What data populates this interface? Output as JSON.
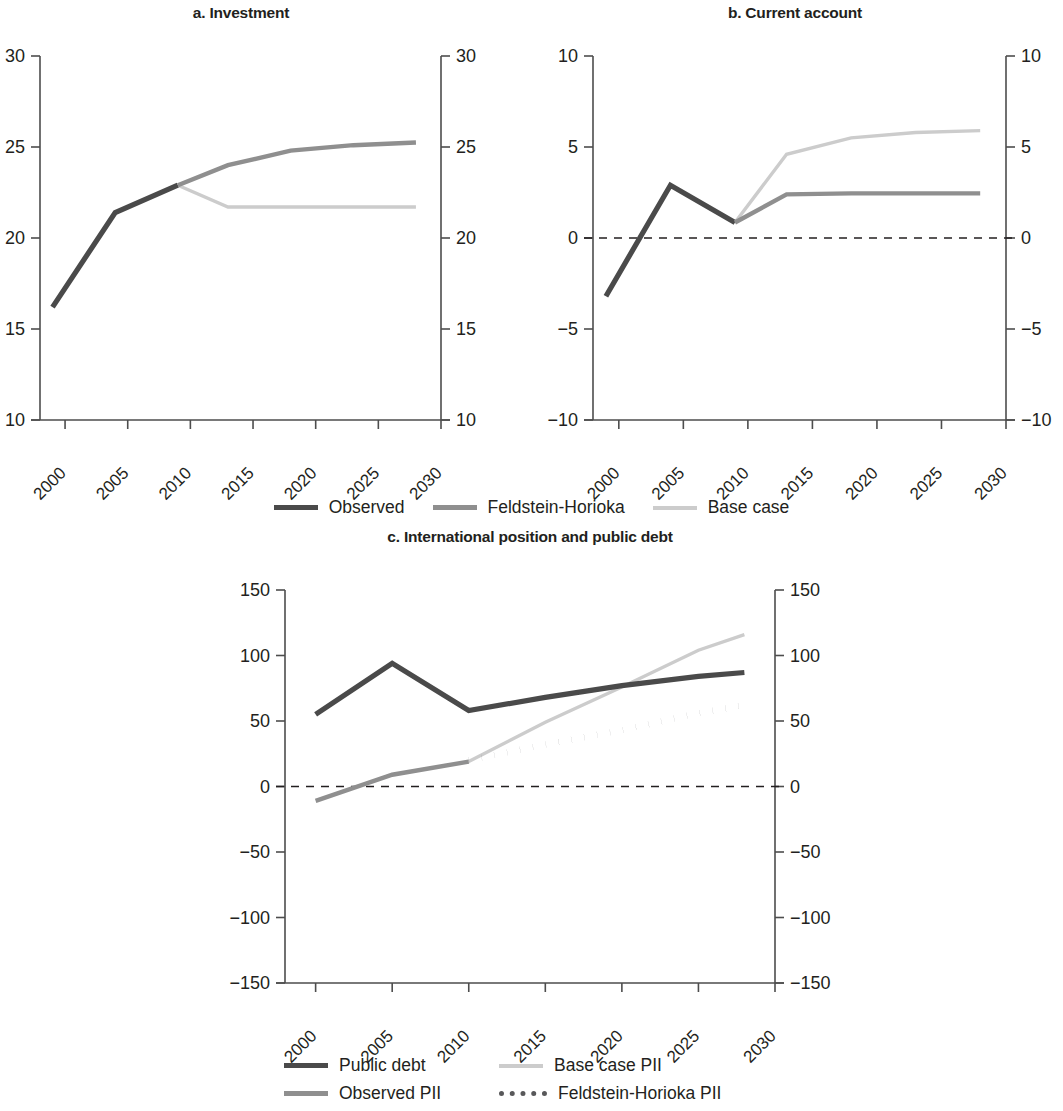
{
  "figure": {
    "panels": [
      {
        "id": "a",
        "title": "a. Investment"
      },
      {
        "id": "b",
        "title": "b. Current account"
      },
      {
        "id": "c",
        "title": "c. International position and public debt"
      }
    ]
  },
  "colors": {
    "observed": "#4a4a4a",
    "feldstein_horioka": "#8f8f8f",
    "base_case": "#cccccc",
    "axis": "#4d4d4d",
    "text": "#231f20"
  },
  "legend_top": {
    "items": [
      {
        "label": "Observed",
        "style": "solid-dark"
      },
      {
        "label": "Feldstein-Horioka",
        "style": "solid-mid"
      },
      {
        "label": "Base case",
        "style": "solid-light"
      }
    ]
  },
  "legend_bottom": {
    "items": [
      {
        "label": "Public debt",
        "style": "solid-dark"
      },
      {
        "label": "Base case PII",
        "style": "solid-light"
      },
      {
        "label": "Observed PII",
        "style": "solid-mid"
      },
      {
        "label": "Feldstein-Horioka PII",
        "style": "dotted-dark"
      }
    ]
  },
  "chart_data": [
    {
      "type": "line",
      "title": "a. Investment",
      "xlabel": "",
      "ylabel": "",
      "xlim": [
        1998,
        2030
      ],
      "ylim": [
        10,
        30
      ],
      "yticks": [
        10,
        15,
        20,
        25,
        30
      ],
      "xticks": [
        2000,
        2005,
        2010,
        2015,
        2020,
        2025,
        2030
      ],
      "grid": false,
      "dual_y_axis": true,
      "legend": "below, shared with panel b",
      "series": [
        {
          "name": "Observed",
          "color": "#4a4a4a",
          "x": [
            1999,
            2004,
            2009
          ],
          "values": [
            16.2,
            21.4,
            22.9
          ]
        },
        {
          "name": "Feldstein-Horioka",
          "color": "#8f8f8f",
          "x": [
            2009,
            2013,
            2018,
            2023,
            2028
          ],
          "values": [
            22.9,
            24.0,
            24.8,
            25.1,
            25.25
          ]
        },
        {
          "name": "Base case",
          "color": "#cccccc",
          "x": [
            2009,
            2013,
            2018,
            2023,
            2028
          ],
          "values": [
            22.9,
            21.7,
            21.7,
            21.7,
            21.7
          ]
        }
      ]
    },
    {
      "type": "line",
      "title": "b. Current account",
      "xlabel": "",
      "ylabel": "",
      "xlim": [
        1998,
        2030
      ],
      "ylim": [
        -10,
        10
      ],
      "yticks": [
        -10,
        -5,
        0,
        5,
        10
      ],
      "xticks": [
        2000,
        2005,
        2010,
        2015,
        2020,
        2025,
        2030
      ],
      "grid": false,
      "zero_line": true,
      "dual_y_axis": true,
      "series": [
        {
          "name": "Observed",
          "color": "#4a4a4a",
          "x": [
            1999,
            2004,
            2009
          ],
          "values": [
            -3.2,
            2.9,
            0.85
          ]
        },
        {
          "name": "Feldstein-Horioka",
          "color": "#8f8f8f",
          "x": [
            2009,
            2013,
            2018,
            2023,
            2028
          ],
          "values": [
            0.85,
            2.4,
            2.45,
            2.45,
            2.45
          ]
        },
        {
          "name": "Base case",
          "color": "#cccccc",
          "x": [
            2009,
            2013,
            2018,
            2023,
            2028
          ],
          "values": [
            0.85,
            4.6,
            5.5,
            5.8,
            5.9
          ]
        }
      ]
    },
    {
      "type": "line",
      "title": "c. International position and public debt",
      "xlabel": "",
      "ylabel": "",
      "xlim": [
        1998,
        2030
      ],
      "ylim": [
        -150,
        150
      ],
      "yticks": [
        -150,
        -100,
        -50,
        0,
        50,
        100,
        150
      ],
      "xticks": [
        2000,
        2005,
        2010,
        2015,
        2020,
        2025,
        2030
      ],
      "grid": false,
      "zero_line": true,
      "dual_y_axis": true,
      "series": [
        {
          "name": "Public debt",
          "color": "#4a4a4a",
          "x": [
            2000,
            2005,
            2010,
            2015,
            2020,
            2025,
            2028
          ],
          "values": [
            55,
            94,
            58,
            68,
            77,
            84,
            87
          ]
        },
        {
          "name": "Observed PII",
          "color": "#8f8f8f",
          "x": [
            2000,
            2005,
            2010
          ],
          "values": [
            -11,
            9,
            19
          ]
        },
        {
          "name": "Base case PII",
          "color": "#cccccc",
          "x": [
            2010,
            2015,
            2020,
            2025,
            2028
          ],
          "values": [
            19,
            49,
            76,
            104,
            116
          ]
        },
        {
          "name": "Feldstein-Horioka PII",
          "color": "#58585a",
          "x": [
            2010,
            2015,
            2020,
            2025,
            2028
          ],
          "values": [
            20,
            32,
            43,
            56,
            62
          ]
        }
      ]
    }
  ]
}
